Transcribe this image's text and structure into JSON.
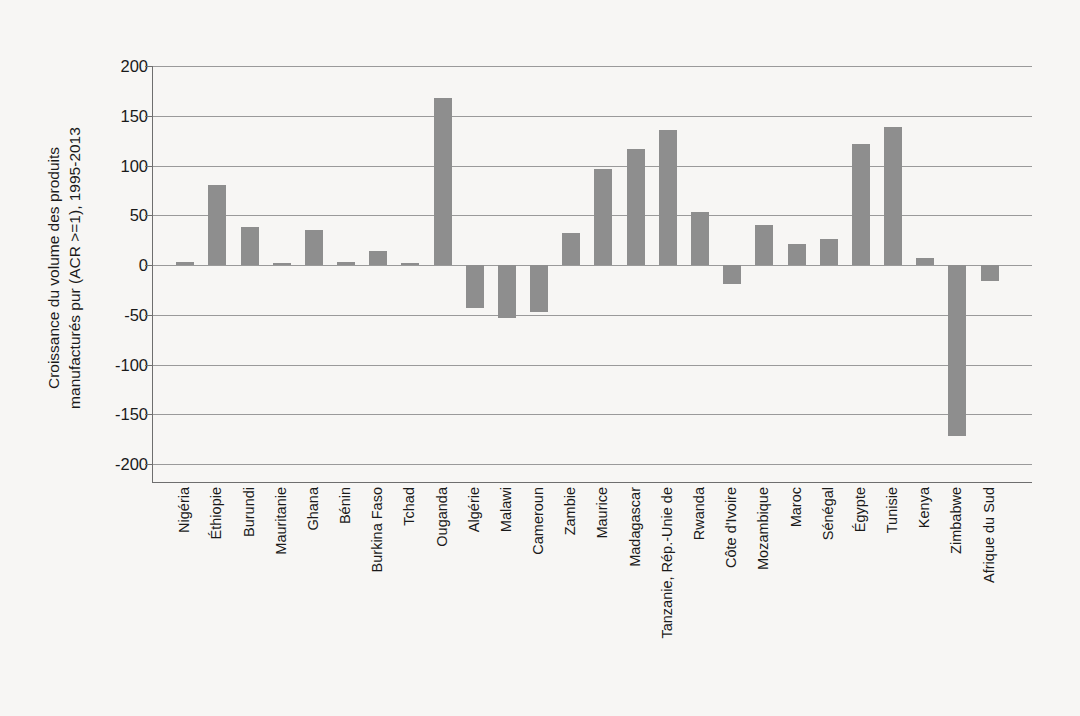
{
  "chart_data": {
    "type": "bar",
    "title": "",
    "subtitle": "",
    "xlabel": "",
    "ylabel_lines": [
      "Croissance du volume des produits",
      "manufacturés pur (ACR >=1), 1995-2013"
    ],
    "ylabel": "Croissance du volume des produits manufacturés pur (ACR >=1), 1995-2013",
    "ylim": [
      -200,
      200
    ],
    "ytick_labels": [
      "200",
      "150",
      "100",
      "50",
      "0",
      "-50",
      "-100",
      "-150",
      "-200"
    ],
    "yticks": [
      200,
      150,
      100,
      50,
      0,
      -50,
      -100,
      -150,
      -200
    ],
    "grid": true,
    "legend": "none",
    "bar_color": "#8e8e8e",
    "background_color": "#f7f6f4",
    "axis_color": "#6e6e6e",
    "gridline_color": "#9a9a9a",
    "categories": [
      "Nigéria",
      "Éthiopie",
      "Burundi",
      "Mauritanie",
      "Ghana",
      "Bénin",
      "Burkina Faso",
      "Tchad",
      "Ouganda",
      "Algérie",
      "Malawi",
      "Cameroun",
      "Zambie",
      "Maurice",
      "Madagascar",
      "Tanzanie, Rép.-Unie de",
      "Rwanda",
      "Côte d'Ivoire",
      "Mozambique",
      "Maroc",
      "Sénégal",
      "Égypte",
      "Tunisie",
      "Kenya",
      "Zimbabwe",
      "Afrique du Sud"
    ],
    "values": [
      3,
      80,
      38,
      2,
      35,
      3,
      14,
      2,
      168,
      -43,
      -53,
      -47,
      32,
      96,
      117,
      136,
      53,
      -19,
      40,
      21,
      26,
      122,
      139,
      7,
      -172,
      -16
    ]
  }
}
